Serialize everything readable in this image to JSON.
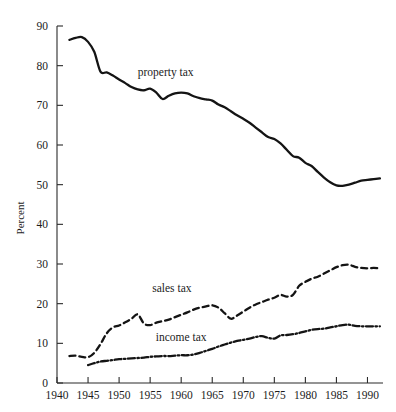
{
  "chart_data": {
    "type": "line",
    "title": "",
    "xlabel": "",
    "ylabel": "Percent",
    "xlim": [
      1940,
      1992.5
    ],
    "ylim": [
      0,
      90
    ],
    "grid": false,
    "legend_position": "inline-annotations",
    "xticks": [
      1940,
      1945,
      1950,
      1955,
      1960,
      1965,
      1970,
      1975,
      1980,
      1985,
      1990
    ],
    "yticks": [
      0,
      10,
      20,
      30,
      40,
      50,
      60,
      70,
      80,
      90
    ],
    "annotations": [
      {
        "text": "property tax",
        "x": 1957.5,
        "y": 77.5
      },
      {
        "text": "sales tax",
        "x": 1958.5,
        "y": 23.0
      },
      {
        "text": "income tax",
        "x": 1960.0,
        "y": 10.5
      }
    ],
    "series": [
      {
        "name": "property tax",
        "style": "solid",
        "x": [
          1942,
          1943,
          1944,
          1945,
          1946,
          1947,
          1948,
          1949,
          1950,
          1951,
          1952,
          1953,
          1954,
          1955,
          1956,
          1957,
          1958,
          1959,
          1960,
          1961,
          1962,
          1963,
          1964,
          1965,
          1966,
          1967,
          1968,
          1969,
          1970,
          1971,
          1972,
          1973,
          1974,
          1975,
          1976,
          1977,
          1978,
          1979,
          1980,
          1981,
          1982,
          1983,
          1984,
          1985,
          1986,
          1987,
          1988,
          1989,
          1990,
          1991,
          1992
        ],
        "values": [
          86.5,
          87.0,
          87.2,
          86.0,
          83.5,
          78.5,
          78.3,
          77.5,
          76.5,
          75.6,
          74.6,
          74.0,
          73.8,
          74.2,
          73.2,
          71.6,
          72.4,
          73.0,
          73.2,
          73.0,
          72.3,
          71.8,
          71.5,
          71.2,
          70.2,
          69.5,
          68.5,
          67.5,
          66.6,
          65.6,
          64.4,
          63.2,
          62.0,
          61.5,
          60.4,
          58.8,
          57.2,
          56.8,
          55.5,
          54.7,
          53.2,
          51.8,
          50.6,
          49.8,
          49.7,
          50.0,
          50.5,
          51.0,
          51.2,
          51.4,
          51.6
        ]
      },
      {
        "name": "sales tax",
        "style": "dashed",
        "x": [
          1942,
          1943,
          1944,
          1945,
          1946,
          1947,
          1948,
          1949,
          1950,
          1951,
          1952,
          1953,
          1954,
          1955,
          1956,
          1957,
          1958,
          1959,
          1960,
          1961,
          1962,
          1963,
          1964,
          1965,
          1966,
          1967,
          1968,
          1969,
          1970,
          1971,
          1972,
          1973,
          1974,
          1975,
          1976,
          1977,
          1978,
          1979,
          1980,
          1981,
          1982,
          1983,
          1984,
          1985,
          1986,
          1987,
          1988,
          1989,
          1990,
          1991,
          1992
        ],
        "values": [
          6.8,
          6.9,
          6.6,
          6.5,
          7.6,
          9.8,
          12.5,
          14.0,
          14.5,
          15.3,
          16.2,
          17.3,
          15.0,
          14.6,
          15.2,
          15.6,
          16.0,
          16.6,
          17.2,
          17.8,
          18.5,
          19.0,
          19.3,
          19.6,
          19.0,
          17.6,
          16.2,
          17.0,
          18.0,
          19.0,
          19.8,
          20.4,
          21.0,
          21.5,
          22.2,
          21.8,
          22.2,
          24.5,
          25.5,
          26.3,
          26.8,
          27.6,
          28.4,
          29.2,
          29.7,
          29.8,
          29.3,
          29.0,
          28.9,
          29.0,
          28.9
        ]
      },
      {
        "name": "income tax",
        "style": "dash-dot",
        "x": [
          1945,
          1946,
          1947,
          1948,
          1949,
          1950,
          1951,
          1952,
          1953,
          1954,
          1955,
          1956,
          1957,
          1958,
          1959,
          1960,
          1961,
          1962,
          1963,
          1964,
          1965,
          1966,
          1967,
          1968,
          1969,
          1970,
          1971,
          1972,
          1973,
          1974,
          1975,
          1976,
          1977,
          1978,
          1979,
          1980,
          1981,
          1982,
          1983,
          1984,
          1985,
          1986,
          1987,
          1988,
          1989,
          1990,
          1991,
          1992
        ],
        "values": [
          4.5,
          5.0,
          5.4,
          5.6,
          5.8,
          6.0,
          6.1,
          6.2,
          6.3,
          6.4,
          6.6,
          6.7,
          6.8,
          6.8,
          6.9,
          7.0,
          7.0,
          7.2,
          7.6,
          8.1,
          8.6,
          9.2,
          9.7,
          10.2,
          10.6,
          10.9,
          11.2,
          11.6,
          11.8,
          11.4,
          11.2,
          12.0,
          12.1,
          12.3,
          12.6,
          13.0,
          13.4,
          13.6,
          13.7,
          14.0,
          14.3,
          14.6,
          14.7,
          14.4,
          14.3,
          14.3,
          14.3,
          14.3
        ]
      }
    ]
  },
  "axis": {
    "ylabel": "Percent"
  },
  "colors": {
    "line": "#141414",
    "axis": "#2b2b2b",
    "background": "#ffffff"
  }
}
